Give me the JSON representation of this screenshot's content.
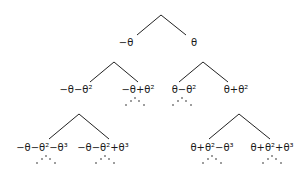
{
  "diagram": {
    "type": "binary-tree",
    "nodes": [
      {
        "id": "root",
        "label": "",
        "x": 161,
        "y": 15
      },
      {
        "id": "n1L",
        "label": "−θ",
        "x": 126,
        "y": 46
      },
      {
        "id": "n1R",
        "label": "θ",
        "x": 194,
        "y": 46
      },
      {
        "id": "n2LL",
        "label": "−θ−θ²",
        "x": 76,
        "y": 93
      },
      {
        "id": "n2LR",
        "label": "−θ+θ²",
        "x": 138,
        "y": 93
      },
      {
        "id": "n2RL",
        "label": "θ−θ²",
        "x": 184,
        "y": 93
      },
      {
        "id": "n2RR",
        "label": "θ+θ²",
        "x": 236,
        "y": 93
      },
      {
        "id": "n3LLL",
        "label": "−θ−θ²−θ³",
        "x": 42,
        "y": 151
      },
      {
        "id": "n3LLR",
        "label": "−θ−θ²+θ³",
        "x": 103,
        "y": 151
      },
      {
        "id": "n3RRL",
        "label": "θ+θ²−θ³",
        "x": 212,
        "y": 151
      },
      {
        "id": "n3RRR",
        "label": "θ+θ²+θ³",
        "x": 272,
        "y": 151
      }
    ],
    "edges": [
      {
        "x1": 161,
        "y1": 15,
        "x2": 137,
        "y2": 35
      },
      {
        "x1": 161,
        "y1": 15,
        "x2": 186,
        "y2": 35
      },
      {
        "x1": 114,
        "y1": 62,
        "x2": 90,
        "y2": 82
      },
      {
        "x1": 114,
        "y1": 62,
        "x2": 138,
        "y2": 82
      },
      {
        "x1": 203,
        "y1": 62,
        "x2": 179,
        "y2": 82
      },
      {
        "x1": 203,
        "y1": 62,
        "x2": 228,
        "y2": 82
      },
      {
        "x1": 79,
        "y1": 114,
        "x2": 49,
        "y2": 139
      },
      {
        "x1": 79,
        "y1": 114,
        "x2": 109,
        "y2": 139
      },
      {
        "x1": 239,
        "y1": 114,
        "x2": 209,
        "y2": 139
      },
      {
        "x1": 239,
        "y1": 114,
        "x2": 270,
        "y2": 139
      }
    ],
    "continuation_dots": [
      {
        "under": "n2LR",
        "cx": 135,
        "cy": 98
      },
      {
        "under": "n2RL",
        "cx": 182,
        "cy": 98
      },
      {
        "under": "n3LLL",
        "cx": 46,
        "cy": 156
      },
      {
        "under": "n3LLR",
        "cx": 105,
        "cy": 156
      },
      {
        "under": "n3RRL",
        "cx": 212,
        "cy": 156
      },
      {
        "under": "n3RRR",
        "cx": 272,
        "cy": 156
      }
    ]
  }
}
